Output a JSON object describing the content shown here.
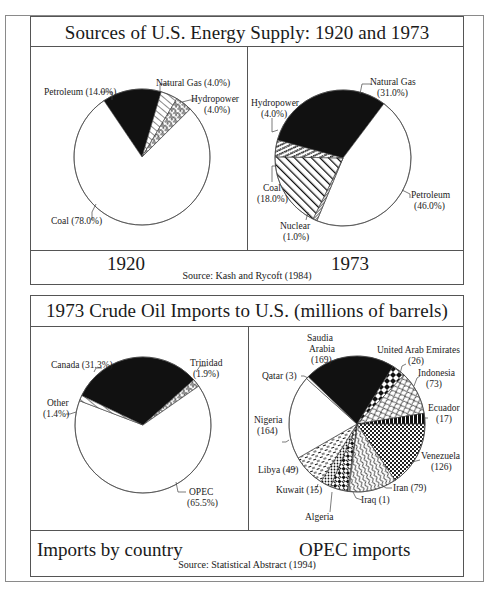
{
  "panel1": {
    "title": "Sources of U.S. Energy Supply: 1920 and 1973",
    "caption_left": "1920",
    "caption_right": "1973",
    "source": "Source: Kash and Rycoft (1984)"
  },
  "panel2": {
    "title": "1973 Crude Oil Imports to U.S. (millions of barrels)",
    "caption_left": "Imports by country",
    "caption_right": "OPEC imports",
    "source": "Source: Statistical Abstract (1994)"
  },
  "labels": {
    "p1920_petroleum": "Petroleum (14.0%)",
    "p1920_natgas": "Natural Gas (4.0%)",
    "p1920_hydro_1": "Hydropower",
    "p1920_hydro_2": "(4.0%)",
    "p1920_coal": "Coal (78.0%)",
    "p1973_natgas_1": "Natural Gas",
    "p1973_natgas_2": "(31.0%)",
    "p1973_hydro_1": "Hydropower",
    "p1973_hydro_2": "(4.0%)",
    "p1973_coal_1": "Coal",
    "p1973_coal_2": "(18.0%)",
    "p1973_petroleum_1": "Petroleum",
    "p1973_petroleum_2": "(46.0%)",
    "p1973_nuclear_1": "Nuclear",
    "p1973_nuclear_2": "(1.0%)",
    "imp_canada": "Canada (31.3%)",
    "imp_trinidad_1": "Trinidad",
    "imp_trinidad_2": "(1.9%)",
    "imp_other_1": "Other",
    "imp_other_2": "(1.4%)",
    "imp_opec_1": "OPEC",
    "imp_opec_2": "(65.5%)",
    "opec_saudi_1": "Saudia",
    "opec_saudi_2": "Arabia",
    "opec_saudi_3": "(169)",
    "opec_uae_1": "United Arab Emirates",
    "opec_uae_2": "(26)",
    "opec_indonesia_1": "Indonesia",
    "opec_indonesia_2": "(73)",
    "opec_ecuador_1": "Ecuador",
    "opec_ecuador_2": "(17)",
    "opec_venezuela_1": "Venezuela",
    "opec_venezuela_2": "(126)",
    "opec_iran": "Iran (79)",
    "opec_iraq": "Iraq (1)",
    "opec_algeria": "Algeria",
    "opec_kuwait": "Kuwait (15)",
    "opec_libya": "Libya (49)",
    "opec_nigeria_1": "Nigeria",
    "opec_nigeria_2": "(164)",
    "opec_qatar": "Qatar (3)"
  },
  "chart_data": [
    {
      "type": "pie",
      "title": "Sources of U.S. Energy Supply: 1920",
      "caption": "1920",
      "source": "Source: Kash and Rycoft (1984)",
      "unit": "%",
      "categories": [
        "Petroleum",
        "Natural Gas",
        "Hydropower",
        "Coal"
      ],
      "values": [
        14.0,
        4.0,
        4.0,
        78.0
      ],
      "geometry": {
        "cx": 142,
        "cy": 157,
        "r": 68
      },
      "slices": [
        {
          "name": "Petroleum",
          "start": -124,
          "end": -73.6,
          "fill": "solid"
        },
        {
          "name": "Natural Gas",
          "start": -73.6,
          "end": -59.2,
          "fill": "diag"
        },
        {
          "name": "Hydropower",
          "start": -59.2,
          "end": -44.8,
          "fill": "meander"
        },
        {
          "name": "Coal",
          "start": -44.8,
          "end": 236,
          "fill": "white"
        }
      ]
    },
    {
      "type": "pie",
      "title": "Sources of U.S. Energy Supply: 1973",
      "caption": "1973",
      "source": "Source: Kash and Rycoft (1984)",
      "unit": "%",
      "categories": [
        "Natural Gas",
        "Petroleum",
        "Nuclear",
        "Coal",
        "Hydropower"
      ],
      "values": [
        31.0,
        46.0,
        1.0,
        18.0,
        4.0
      ],
      "geometry": {
        "cx": 343,
        "cy": 158,
        "r": 68
      },
      "slices": [
        {
          "name": "Natural Gas",
          "start": -164.6,
          "end": -53,
          "fill": "solid"
        },
        {
          "name": "Petroleum",
          "start": -53,
          "end": 112.6,
          "fill": "white"
        },
        {
          "name": "Nuclear",
          "start": 112.6,
          "end": 116.2,
          "fill": "dense"
        },
        {
          "name": "Coal",
          "start": 116.2,
          "end": 181,
          "fill": "diagbold"
        },
        {
          "name": "Hydropower",
          "start": 181,
          "end": 195.4,
          "fill": "zigzag"
        }
      ]
    },
    {
      "type": "pie",
      "title": "1973 Crude Oil Imports to U.S. (millions of barrels)",
      "caption": "Imports by country",
      "source": "Source: Statistical Abstract (1994)",
      "unit": "%",
      "categories": [
        "Canada",
        "Trinidad",
        "OPEC",
        "Other"
      ],
      "values": [
        31.3,
        1.9,
        65.5,
        1.4
      ],
      "geometry": {
        "cx": 143,
        "cy": 425,
        "r": 68
      },
      "slices": [
        {
          "name": "Canada",
          "start": -154.4,
          "end": -41.7,
          "fill": "solid"
        },
        {
          "name": "Trinidad",
          "start": -41.7,
          "end": -34.9,
          "fill": "meander"
        },
        {
          "name": "OPEC",
          "start": -34.9,
          "end": 200.9,
          "fill": "white"
        },
        {
          "name": "Other",
          "start": 200.9,
          "end": 205.6,
          "fill": "diag"
        }
      ]
    },
    {
      "type": "pie",
      "title": "1973 Crude Oil Imports to U.S. (millions of barrels)",
      "caption": "OPEC imports",
      "source": "Source: Statistical Abstract (1994)",
      "unit": "millions of barrels",
      "categories": [
        "Saudia Arabia",
        "United Arab Emirates",
        "Indonesia",
        "Ecuador",
        "Venezuela",
        "Iran",
        "Iraq",
        "Algeria",
        "Kuwait",
        "Libya",
        "Nigeria",
        "Qatar"
      ],
      "values": [
        169,
        26,
        73,
        17,
        126,
        79,
        1,
        null,
        15,
        49,
        164,
        3
      ],
      "geometry": {
        "cx": 357,
        "cy": 424,
        "r": 68
      },
      "slices": [
        {
          "name": "Saudia Arabia",
          "start": -136,
          "end": -58,
          "fill": "solid"
        },
        {
          "name": "United Arab Emirates",
          "start": -58,
          "end": -46,
          "fill": "diamonds"
        },
        {
          "name": "Indonesia",
          "start": -46,
          "end": -9,
          "fill": "scales"
        },
        {
          "name": "Ecuador",
          "start": -9,
          "end": 0,
          "fill": "bars"
        },
        {
          "name": "Venezuela",
          "start": 0,
          "end": 56,
          "fill": "checker"
        },
        {
          "name": "Iran",
          "start": 56,
          "end": 97,
          "fill": "wave"
        },
        {
          "name": "Iraq",
          "start": 97,
          "end": 98,
          "fill": "white"
        },
        {
          "name": "Algeria",
          "start": 98,
          "end": 113,
          "fill": "weave"
        },
        {
          "name": "Kuwait",
          "start": 113,
          "end": 122,
          "fill": "dots"
        },
        {
          "name": "Libya",
          "start": 122,
          "end": 150,
          "fill": "dash"
        },
        {
          "name": "Nigeria",
          "start": 150,
          "end": 222,
          "fill": "white"
        },
        {
          "name": "Qatar",
          "start": 222,
          "end": 224,
          "fill": "white"
        }
      ]
    }
  ]
}
